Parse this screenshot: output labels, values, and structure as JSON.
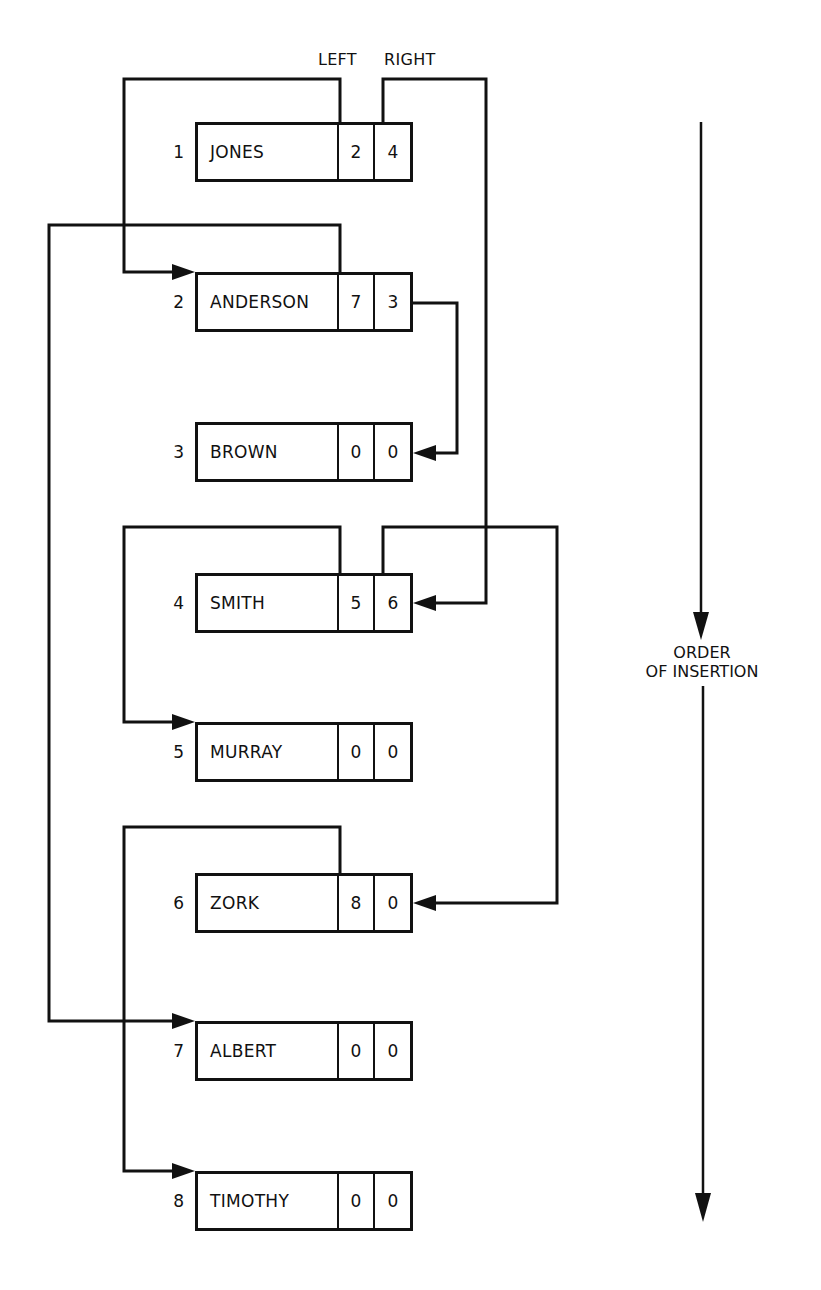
{
  "header": {
    "left_label": "LEFT",
    "right_label": "RIGHT"
  },
  "side_label": {
    "line1": "ORDER",
    "line2": "OF INSERTION"
  },
  "nodes": [
    {
      "index": "1",
      "name": "JONES",
      "left": "2",
      "right": "4"
    },
    {
      "index": "2",
      "name": "ANDERSON",
      "left": "7",
      "right": "3"
    },
    {
      "index": "3",
      "name": "BROWN",
      "left": "0",
      "right": "0"
    },
    {
      "index": "4",
      "name": "SMITH",
      "left": "5",
      "right": "6"
    },
    {
      "index": "5",
      "name": "MURRAY",
      "left": "0",
      "right": "0"
    },
    {
      "index": "6",
      "name": "ZORK",
      "left": "8",
      "right": "0"
    },
    {
      "index": "7",
      "name": "ALBERT",
      "left": "0",
      "right": "0"
    },
    {
      "index": "8",
      "name": "TIMOTHY",
      "left": "0",
      "right": "0"
    }
  ],
  "colors": {
    "ink": "#111111",
    "paper": "#ffffff"
  }
}
